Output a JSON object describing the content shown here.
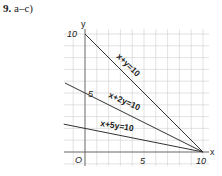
{
  "problem": {
    "number": "9.",
    "parts": "a–c)"
  },
  "chart_data": {
    "type": "line",
    "title": "",
    "xlabel": "x",
    "ylabel": "y",
    "xlim": [
      -1.8,
      10.5
    ],
    "ylim": [
      -1.1,
      10.5
    ],
    "grid": true,
    "x_ticks": [
      {
        "value": 0,
        "label": "O"
      },
      {
        "value": 5,
        "label": "5"
      },
      {
        "value": 10,
        "label": "10"
      }
    ],
    "y_ticks": [
      {
        "value": 5,
        "label": "5"
      },
      {
        "value": 10,
        "label": "10"
      }
    ],
    "series": [
      {
        "name": "x+y=10",
        "label": "x+y=10",
        "points": [
          [
            0,
            10
          ],
          [
            10,
            0
          ]
        ]
      },
      {
        "name": "x+2y=10",
        "label": "x+2y=10",
        "points": [
          [
            -1.7,
            5.85
          ],
          [
            10,
            0
          ]
        ]
      },
      {
        "name": "x+5y=10",
        "label": "x+5y=10",
        "points": [
          [
            -1.8,
            2.36
          ],
          [
            10,
            0
          ]
        ]
      }
    ],
    "intersection_point": [
      10,
      0
    ]
  }
}
